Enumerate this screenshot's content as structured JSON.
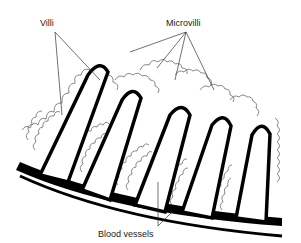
{
  "diagram": {
    "labels": {
      "villi": "Villi",
      "microvilli": "Microvilli",
      "blood_vessels": "Blood vessels"
    },
    "parts": [
      {
        "name": "villi",
        "count": 5,
        "shape": "finger-like projections"
      },
      {
        "name": "microvilli",
        "shape": "wavy fringe on villus surface"
      },
      {
        "name": "blood-vessels",
        "shape": "black band at base of villi"
      }
    ],
    "colors": {
      "outline": "#000000",
      "microvilli": "#555555",
      "background": "#ffffff"
    }
  }
}
